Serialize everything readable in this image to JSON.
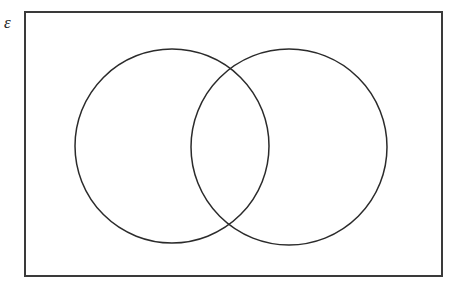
{
  "diagram": {
    "kind": "venn-diagram",
    "background_color": "#ffffff",
    "universal_set": {
      "label": "ε",
      "label_name": "universal-set-label",
      "shape": "rectangle",
      "x": 24,
      "y": 11,
      "width": 419,
      "height": 266,
      "stroke_color": "#3a3a3a",
      "stroke_width": 2,
      "fill": "none"
    },
    "sets": [
      {
        "name": "left-set",
        "label": "",
        "shape": "circle",
        "cx": 172,
        "cy": 146,
        "r": 97,
        "stroke_color": "#2b2b2b",
        "stroke_width": 1.5,
        "fill": "none"
      },
      {
        "name": "right-set",
        "label": "",
        "shape": "circle",
        "cx": 289,
        "cy": 147,
        "r": 98,
        "stroke_color": "#2b2b2b",
        "stroke_width": 1.5,
        "fill": "none"
      }
    ],
    "intersection_points": [
      {
        "name": "upper-intersection",
        "x": 230,
        "y": 71
      },
      {
        "name": "lower-intersection",
        "x": 231,
        "y": 223
      }
    ],
    "region_labels": []
  }
}
